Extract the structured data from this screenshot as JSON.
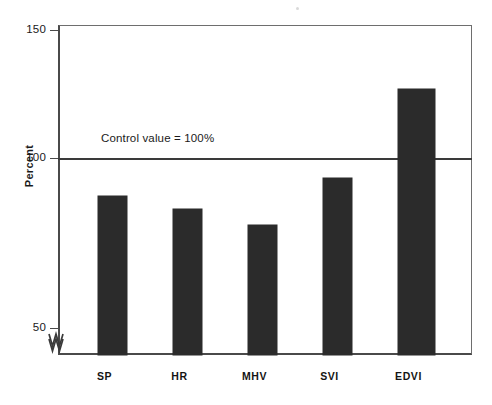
{
  "chart_data": {
    "type": "bar",
    "title": "",
    "xlabel": "",
    "ylabel": "Percent",
    "categories": [
      "SP",
      "HR",
      "MHV",
      "SVI",
      "EDVI"
    ],
    "values": [
      85,
      80,
      74,
      92,
      127
    ],
    "ylim": [
      50,
      150
    ],
    "yticks": [
      50,
      100,
      150
    ],
    "ytick_labels": [
      "50",
      "100",
      "150"
    ],
    "grid": false,
    "legend": null,
    "axis_break": {
      "present": true,
      "symbol": "zigzag",
      "position": "y-axis below 50",
      "note": "y-axis is broken below 50"
    },
    "reference_line": {
      "value": 100,
      "label": "Control value = 100%"
    },
    "bar_color": "#2b2b2b",
    "axis_color": "#4a4a4a",
    "background_color": "#ffffff",
    "annotations": [
      {
        "text": "Control value = 100%",
        "x": "SP-HR",
        "y": 106
      }
    ]
  },
  "axis": {
    "y_title": "Percent",
    "ticks": [
      {
        "label": "150",
        "value": 150
      },
      {
        "label": "100",
        "value": 100
      },
      {
        "label": "50",
        "value": 50
      }
    ]
  }
}
